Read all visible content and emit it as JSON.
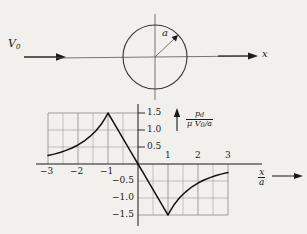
{
  "figure": {
    "background_color": "#f2f0ec",
    "ink_color": "#1a1a1a",
    "grid_color": "#8a8a8a"
  },
  "top_diagram": {
    "name": "uniform-flow-past-circular-cylinder",
    "freestream_label": "V",
    "freestream_subscript": "0",
    "radius_label": "a",
    "axis_label": "x",
    "circle": {
      "center_x": 155,
      "center_y": 57,
      "radius": 32
    },
    "radius_arrow": {
      "angle_deg": 45,
      "from": "center",
      "to": "circle-edge"
    }
  },
  "chart_data": {
    "type": "line",
    "title": "",
    "subtitle": "",
    "xlabel_numerator": "x",
    "xlabel_denominator": "a",
    "ylabel_numerator": "p",
    "ylabel_numerator_sub": "d",
    "ylabel_denominator": "μ V",
    "ylabel_denominator_sub": "0",
    "ylabel_denominator_tail": "/a",
    "xlim": [
      -3,
      3
    ],
    "ylim": [
      -1.5,
      1.5
    ],
    "xticks": [
      -3,
      -2,
      -1,
      1,
      2,
      3
    ],
    "xtick_labels": [
      "−3",
      "−2",
      "−1",
      "1",
      "2",
      "3"
    ],
    "yticks": [
      1.5,
      1.0,
      0.5,
      -0.5,
      -1.0,
      -1.5
    ],
    "ytick_labels": [
      "1.5",
      "1.0",
      "0.5",
      "−0.5",
      "−1.0",
      "−1.5"
    ],
    "grid": true,
    "grid_step_x": 0.5,
    "grid_step_y": 0.5,
    "grid_boxes": [
      {
        "name": "upper-left-grid",
        "x_range": [
          -3,
          0
        ],
        "y_range": [
          0,
          1.5
        ]
      },
      {
        "name": "lower-right-grid",
        "x_range": [
          0,
          3
        ],
        "y_range": [
          -1.5,
          0
        ]
      }
    ],
    "legend": [],
    "annotations": [
      {
        "label": "peak",
        "x": -1,
        "y": 1.5
      },
      {
        "label": "trough",
        "x": 1,
        "y": -1.5
      }
    ],
    "series": [
      {
        "name": "dynamic-pressure-distribution",
        "points": [
          [
            -3.0,
            0.25
          ],
          [
            -2.8,
            0.29
          ],
          [
            -2.6,
            0.34
          ],
          [
            -2.4,
            0.4
          ],
          [
            -2.2,
            0.47
          ],
          [
            -2.0,
            0.56
          ],
          [
            -1.8,
            0.67
          ],
          [
            -1.6,
            0.81
          ],
          [
            -1.4,
            0.98
          ],
          [
            -1.2,
            1.2
          ],
          [
            -1.1,
            1.34
          ],
          [
            -1.0,
            1.5
          ],
          [
            -0.8,
            1.2
          ],
          [
            -0.6,
            0.9
          ],
          [
            -0.4,
            0.6
          ],
          [
            -0.2,
            0.3
          ],
          [
            0.0,
            0.0
          ],
          [
            0.2,
            -0.3
          ],
          [
            0.4,
            -0.6
          ],
          [
            0.6,
            -0.9
          ],
          [
            0.8,
            -1.2
          ],
          [
            1.0,
            -1.5
          ],
          [
            1.1,
            -1.34
          ],
          [
            1.2,
            -1.2
          ],
          [
            1.4,
            -0.98
          ],
          [
            1.6,
            -0.81
          ],
          [
            1.8,
            -0.67
          ],
          [
            2.0,
            -0.56
          ],
          [
            2.2,
            -0.47
          ],
          [
            2.4,
            -0.4
          ],
          [
            2.6,
            -0.34
          ],
          [
            2.8,
            -0.29
          ],
          [
            3.0,
            -0.25
          ]
        ]
      }
    ]
  }
}
